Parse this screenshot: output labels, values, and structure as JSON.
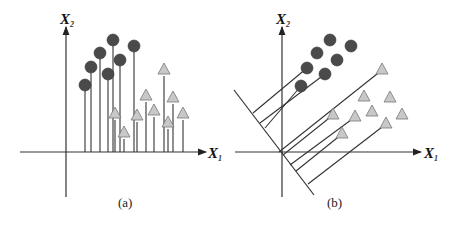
{
  "figure": {
    "panels": [
      {
        "id": "a",
        "caption": "(a)",
        "x_axis_label": "X",
        "x_axis_sub": "1",
        "y_axis_label": "X",
        "y_axis_sub": "2",
        "origin": [
          66,
          152
        ],
        "description": "Two classes projected onto X1 axis; projections overlap"
      },
      {
        "id": "b",
        "caption": "(b)",
        "x_axis_label": "X",
        "x_axis_sub": "1",
        "y_axis_label": "X",
        "y_axis_sub": "2",
        "origin": [
          282,
          152
        ],
        "description": "Two classes projected onto an oblique line; projections separated"
      }
    ],
    "legend": {
      "class1_shape": "circle",
      "class1_color": "#4a4a4a",
      "class2_shape": "triangle",
      "class2_color": "#c8c8c8"
    }
  }
}
